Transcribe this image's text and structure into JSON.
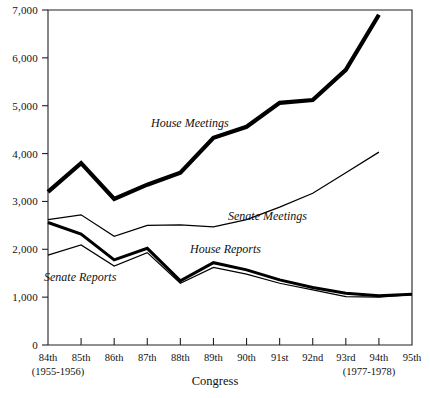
{
  "chart_data": {
    "type": "line",
    "title": "",
    "xlabel": "Congress",
    "ylabel": "",
    "ylim": [
      0,
      7000
    ],
    "ytick_values": [
      0,
      1000,
      2000,
      3000,
      4000,
      5000,
      6000,
      7000
    ],
    "ytick_labels": [
      "0",
      "1,000",
      "2,000",
      "3,000",
      "4,000",
      "5,000",
      "6,000",
      "7,000"
    ],
    "grid": false,
    "legend_position": "inline-annotations",
    "categories": [
      "84th",
      "85th",
      "86th",
      "87th",
      "88th",
      "89th",
      "90th",
      "91st",
      "92nd",
      "93rd",
      "94th",
      "95th"
    ],
    "xtick_sublabels": {
      "84th": "(1955-1956)",
      "94th": "(1977-1978)"
    },
    "series": [
      {
        "name": "House Meetings",
        "style": "thick",
        "values": [
          3200,
          3800,
          3050,
          3350,
          3600,
          4330,
          4560,
          5060,
          5120,
          5750,
          6900,
          null
        ]
      },
      {
        "name": "Senate Meetings",
        "style": "thin",
        "values": [
          2620,
          2720,
          2270,
          2500,
          2510,
          2470,
          2620,
          2880,
          3170,
          3600,
          4030,
          null
        ]
      },
      {
        "name": "House Reports",
        "style": "medium",
        "values": [
          2560,
          2320,
          1780,
          2020,
          1340,
          1720,
          1570,
          1360,
          1200,
          1080,
          1030,
          1060
        ]
      },
      {
        "name": "Senate Reports",
        "style": "thin",
        "values": [
          1880,
          2090,
          1650,
          1930,
          1290,
          1620,
          1480,
          1290,
          1150,
          1010,
          1000,
          1050
        ]
      }
    ],
    "annotations": [
      {
        "text": "House Meetings",
        "x_px": 151,
        "y_px": 127
      },
      {
        "text": "Senate Meetings",
        "x_px": 228,
        "y_px": 220
      },
      {
        "text": "House Reports",
        "x_px": 190,
        "y_px": 253
      },
      {
        "text": "Senate Reports",
        "x_px": 44,
        "y_px": 281
      }
    ]
  },
  "colors": {
    "background": "#ffffff",
    "ink": "#111111",
    "line": "#000000"
  }
}
